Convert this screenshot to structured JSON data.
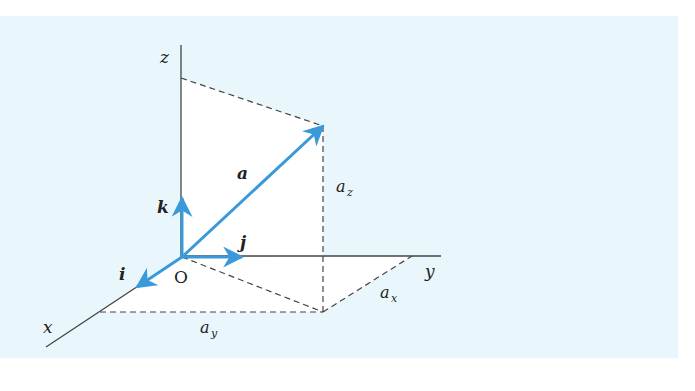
{
  "diagram": {
    "title": "",
    "axes": [
      {
        "name": "x",
        "label": "x"
      },
      {
        "name": "y",
        "label": "y"
      },
      {
        "name": "z",
        "label": "z"
      }
    ],
    "origin_label": "O",
    "vector": {
      "label": "a",
      "color": "#3a9ad9"
    },
    "unit_vectors": [
      {
        "label": "i",
        "axis": "x"
      },
      {
        "label": "j",
        "axis": "y"
      },
      {
        "label": "k",
        "axis": "z"
      }
    ],
    "components": [
      {
        "label": "a",
        "sub": "x"
      },
      {
        "label": "a",
        "sub": "y"
      },
      {
        "label": "a",
        "sub": "z"
      }
    ],
    "colors": {
      "background_panel": "#e9f7fc",
      "projection_fill": "#ffffff",
      "axis_line": "#444444",
      "vector": "#3a9ad9",
      "dashed": "#444444"
    }
  }
}
